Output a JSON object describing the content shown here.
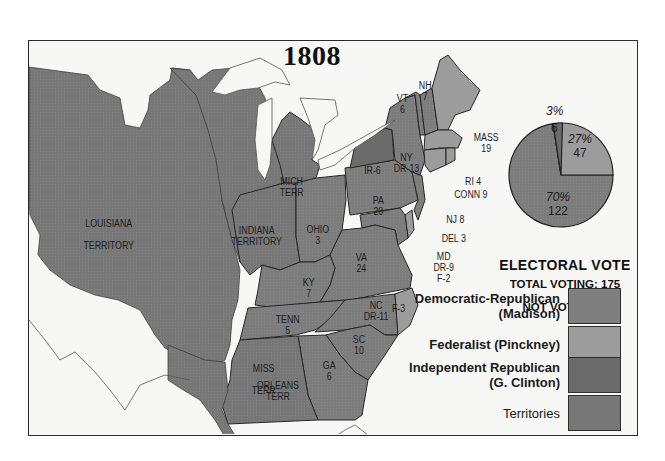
{
  "map": {
    "title": "1808",
    "colors": {
      "democratic_republican": "#7f7f7f",
      "federalist": "#9c9c9c",
      "independent_republican": "#6b6b6b",
      "territories": "#777777",
      "water_background": "#f7f7f6",
      "border": "#262626"
    },
    "regions": [
      {
        "id": "louisiana",
        "label": "LOUISIANA\n\nTERRITORY",
        "type": "territory"
      },
      {
        "id": "indiana",
        "label": "INDIANA\nTERRITORY",
        "type": "territory"
      },
      {
        "id": "mich",
        "label": "MICH\nTERR",
        "type": "territory"
      },
      {
        "id": "miss",
        "label": "MISS\n\nTERR",
        "type": "territory"
      },
      {
        "id": "orleans",
        "label": "ORLEANS\nTERR",
        "type": "territory"
      },
      {
        "id": "ohio",
        "label": "OHIO\n3",
        "type": "state"
      },
      {
        "id": "ky",
        "label": "KY\n7",
        "type": "state"
      },
      {
        "id": "tenn",
        "label": "TENN\n5",
        "type": "state"
      },
      {
        "id": "va",
        "label": "VA\n24",
        "type": "state"
      },
      {
        "id": "pa",
        "label": "PA\n20",
        "type": "state"
      },
      {
        "id": "ny",
        "label": "NY\nDR-13",
        "type": "state"
      },
      {
        "id": "ny_ir",
        "label": "IR-6",
        "type": "state"
      },
      {
        "id": "vt",
        "label": "VT\n6",
        "type": "state"
      },
      {
        "id": "nh",
        "label": "NH\n7",
        "type": "state"
      },
      {
        "id": "mass",
        "label": "MASS\n19",
        "type": "state"
      },
      {
        "id": "ri",
        "label": "RI 4",
        "type": "state"
      },
      {
        "id": "conn",
        "label": "CONN 9",
        "type": "state"
      },
      {
        "id": "nj",
        "label": "NJ 8",
        "type": "state"
      },
      {
        "id": "del",
        "label": "DEL 3",
        "type": "state"
      },
      {
        "id": "md",
        "label": "MD\nDR-9\nF-2",
        "type": "state"
      },
      {
        "id": "nc",
        "label": "NC\nDR-11",
        "type": "state"
      },
      {
        "id": "nc_f",
        "label": "F-3",
        "type": "state"
      },
      {
        "id": "sc",
        "label": "SC\n10",
        "type": "state"
      },
      {
        "id": "ga",
        "label": "GA\n6",
        "type": "state"
      }
    ]
  },
  "electoral_vote": {
    "title": "ELECTORAL  VOTE",
    "total_voting": "TOTAL VOTING: 175",
    "not_voting": "NOT VOTING: 1",
    "pie": [
      {
        "party": "Democratic-Republican",
        "percent": "70%",
        "votes": "122",
        "value": 122
      },
      {
        "party": "Federalist",
        "percent": "27%",
        "votes": "47",
        "value": 47
      },
      {
        "party": "Independent Republican",
        "percent": "3%",
        "votes": "6",
        "value": 6
      }
    ]
  },
  "legend": [
    {
      "line1": "Democratic-Republican",
      "line2": "(Madison)",
      "color": "#7f7f7f"
    },
    {
      "line1": "Federalist (Pinckney)",
      "line2": "",
      "color": "#9c9c9c"
    },
    {
      "line1": "Independent Republican",
      "line2": "(G. Clinton)",
      "color": "#6b6b6b"
    },
    {
      "line1": "Territories",
      "line2": "",
      "color": "#777777"
    }
  ],
  "chart_data": {
    "type": "pie",
    "title": "ELECTORAL VOTE",
    "categories": [
      "Democratic-Republican (Madison)",
      "Federalist (Pinckney)",
      "Independent Republican (G. Clinton)"
    ],
    "values": [
      122,
      47,
      6
    ],
    "percent_labels": [
      "70%",
      "27%",
      "3%"
    ],
    "annotations": [
      "TOTAL VOTING: 175",
      "NOT VOTING: 1"
    ]
  }
}
